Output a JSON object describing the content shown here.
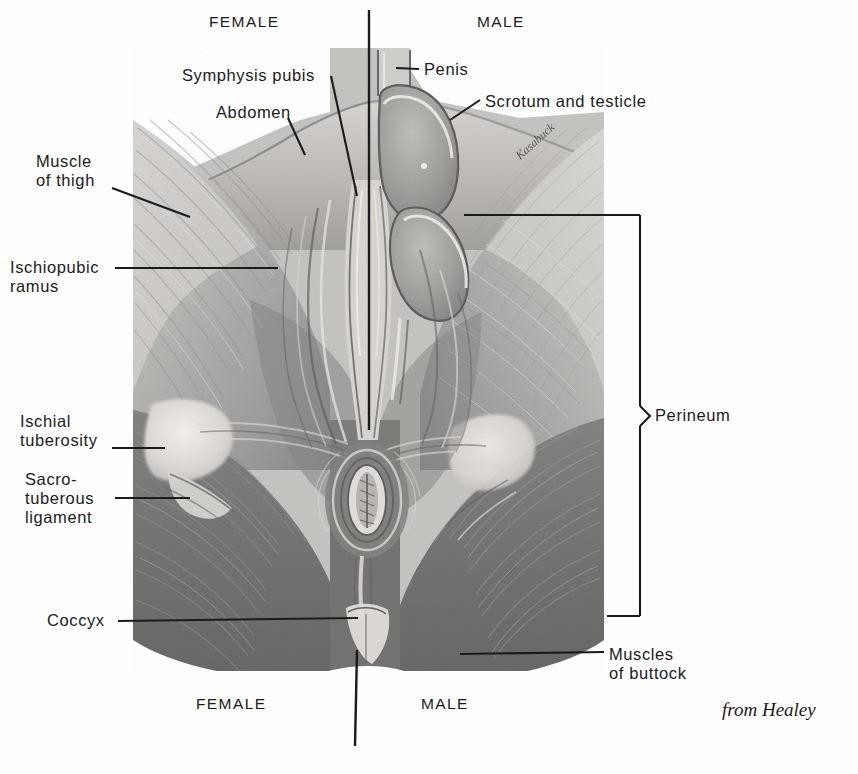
{
  "figure": {
    "credit": "from Healey",
    "side_headings": {
      "female_top": "FEMALE",
      "male_top": "MALE",
      "female_bottom": "FEMALE",
      "male_bottom": "MALE"
    },
    "colors": {
      "ink": "#1b1b1b",
      "background": "#ffffff",
      "plate_light": "#cfcfcf",
      "plate_mid": "#9a9a9a",
      "plate_dark": "#5e5e5e",
      "plate_darkest": "#3a3a3a",
      "highlight": "#e8e6e1"
    },
    "labels": [
      {
        "id": "symphysis-pubis",
        "text": "Symphysis pubis",
        "x": 182,
        "y": 66,
        "align": "left"
      },
      {
        "id": "abdomen",
        "text": "Abdomen",
        "x": 216,
        "y": 103,
        "align": "left"
      },
      {
        "id": "muscle-of-thigh",
        "text": "Muscle\nof thigh",
        "x": 36,
        "y": 152,
        "align": "left"
      },
      {
        "id": "ischiopubic-ramus",
        "text": "Ischiopubic\nramus",
        "x": 10,
        "y": 258,
        "align": "left"
      },
      {
        "id": "ischial-tuberosity",
        "text": "Ischial\ntuberosity",
        "x": 20,
        "y": 412,
        "align": "left"
      },
      {
        "id": "sacrotuberous-ligament",
        "text": "Sacro-\ntuberous\nligament",
        "x": 25,
        "y": 470,
        "align": "left"
      },
      {
        "id": "coccyx",
        "text": "Coccyx",
        "x": 47,
        "y": 611,
        "align": "left"
      },
      {
        "id": "penis",
        "text": "Penis",
        "x": 424,
        "y": 60,
        "align": "left"
      },
      {
        "id": "scrotum-and-testicle",
        "text": "Scrotum and testicle",
        "x": 485,
        "y": 92,
        "align": "left"
      },
      {
        "id": "perineum",
        "text": "Perineum",
        "x": 655,
        "y": 406,
        "align": "left"
      },
      {
        "id": "muscles-of-buttock",
        "text": "Muscles\nof buttock",
        "x": 609,
        "y": 645,
        "align": "left"
      }
    ],
    "heading_positions": {
      "female_top": {
        "x": 209,
        "y": 12
      },
      "male_top": {
        "x": 477,
        "y": 12
      },
      "female_bottom": {
        "x": 196,
        "y": 694
      },
      "male_bottom": {
        "x": 421,
        "y": 694
      }
    },
    "credit_position": {
      "x": 722,
      "y": 699
    },
    "plate": {
      "x": 133,
      "y": 48,
      "width": 471,
      "height": 623
    },
    "divider": {
      "x_top": 369,
      "y_top": 10,
      "y_top_end": 430,
      "x_bottom": 356,
      "y_bottom": 650,
      "y_bottom_end": 746
    },
    "perineum_bracket": {
      "x": 640,
      "y_top": 215,
      "y_bottom": 616,
      "tip_x": 652,
      "tip_y": 416
    },
    "artist_mark": "Kasabuck"
  }
}
